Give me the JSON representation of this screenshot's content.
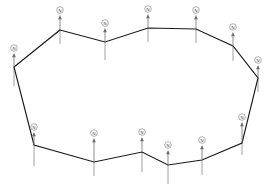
{
  "figure": {
    "title": "",
    "type": "ring-vector-diagram",
    "background_color": "#ffffff",
    "edge_color": "#1a1a1a",
    "vector_color": "#6f6f6f",
    "label_circle_fill": "#ffffff",
    "label_circle_stroke": "#8c8c8c",
    "label_text_color": "#3a3a3a",
    "vertex_count": 14
  },
  "chart_data": {
    "type": "scatter",
    "title": "",
    "xlabel": "",
    "ylabel": "",
    "xlim": [
      0,
      272
    ],
    "ylim": [
      0,
      193
    ],
    "grid": false,
    "legend": null,
    "annotations": [],
    "series": [
      {
        "name": "ring-vertices",
        "closed": true,
        "points": [
          {
            "id": "v1",
            "label": "N",
            "x": 60,
            "y": 30,
            "label_x": 60,
            "label_y": 10,
            "arrow_top": 15,
            "tail_bottom": 44
          },
          {
            "id": "v2",
            "label": "N",
            "x": 105,
            "y": 42,
            "label_x": 105,
            "label_y": 23,
            "arrow_top": 28,
            "tail_bottom": 60
          },
          {
            "id": "v3",
            "label": "N",
            "x": 148,
            "y": 28,
            "label_x": 148,
            "label_y": 9,
            "arrow_top": 14,
            "tail_bottom": 42
          },
          {
            "id": "v4",
            "label": "N",
            "x": 196,
            "y": 29,
            "label_x": 196,
            "label_y": 10,
            "arrow_top": 15,
            "tail_bottom": 43
          },
          {
            "id": "v5",
            "label": "N",
            "x": 233,
            "y": 46,
            "label_x": 233,
            "label_y": 27,
            "arrow_top": 32,
            "tail_bottom": 61
          },
          {
            "id": "v6",
            "label": "N",
            "x": 258,
            "y": 78,
            "label_x": 258,
            "label_y": 60,
            "arrow_top": 65,
            "tail_bottom": 92
          },
          {
            "id": "v7",
            "label": "N",
            "x": 242,
            "y": 143,
            "label_x": 242,
            "label_y": 117,
            "arrow_top": 122,
            "tail_bottom": 155
          },
          {
            "id": "v8",
            "label": "N",
            "x": 202,
            "y": 160,
            "label_x": 202,
            "label_y": 140,
            "arrow_top": 145,
            "tail_bottom": 175
          },
          {
            "id": "v9",
            "label": "N",
            "x": 168,
            "y": 165,
            "label_x": 168,
            "label_y": 145,
            "arrow_top": 150,
            "tail_bottom": 184
          },
          {
            "id": "v10",
            "label": "N",
            "x": 142,
            "y": 152,
            "label_x": 142,
            "label_y": 132,
            "arrow_top": 137,
            "tail_bottom": 172
          },
          {
            "id": "v11",
            "label": "N",
            "x": 94,
            "y": 162,
            "label_x": 94,
            "label_y": 133,
            "arrow_top": 138,
            "tail_bottom": 176
          },
          {
            "id": "v12",
            "label": "N",
            "x": 34,
            "y": 145,
            "label_x": 34,
            "label_y": 127,
            "arrow_top": 132,
            "tail_bottom": 166
          },
          {
            "id": "v13",
            "label": "N",
            "x": 14,
            "y": 67,
            "label_x": 14,
            "label_y": 48,
            "arrow_top": 53,
            "tail_bottom": 86
          },
          {
            "id": "v14",
            "label": "N",
            "x": 60,
            "y": 30,
            "label_x": 60,
            "label_y": 10,
            "arrow_top": 15,
            "tail_bottom": 44
          }
        ]
      }
    ]
  }
}
